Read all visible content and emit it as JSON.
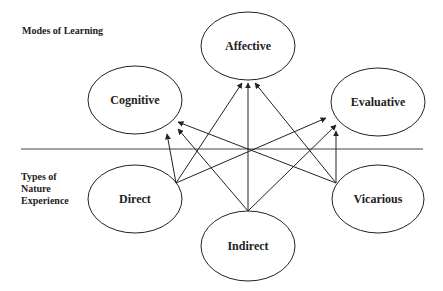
{
  "labels": {
    "modes_of_learning": "Modes of Learning",
    "types_line1": "Types of",
    "types_line2": "Nature",
    "types_line3": "Experience"
  },
  "modes": [
    {
      "id": "cognitive",
      "label": "Cognitive"
    },
    {
      "id": "affective",
      "label": "Affective"
    },
    {
      "id": "evaluative",
      "label": "Evaluative"
    }
  ],
  "types": [
    {
      "id": "direct",
      "label": "Direct"
    },
    {
      "id": "indirect",
      "label": "Indirect"
    },
    {
      "id": "vicarious",
      "label": "Vicarious"
    }
  ],
  "edges": [
    {
      "from": "Direct",
      "to": "Cognitive"
    },
    {
      "from": "Direct",
      "to": "Affective"
    },
    {
      "from": "Direct",
      "to": "Evaluative"
    },
    {
      "from": "Indirect",
      "to": "Cognitive"
    },
    {
      "from": "Indirect",
      "to": "Affective"
    },
    {
      "from": "Indirect",
      "to": "Evaluative"
    },
    {
      "from": "Vicarious",
      "to": "Cognitive"
    },
    {
      "from": "Vicarious",
      "to": "Affective"
    },
    {
      "from": "Vicarious",
      "to": "Evaluative"
    }
  ],
  "colors": {
    "stroke": "#222222",
    "background": "#ffffff"
  }
}
